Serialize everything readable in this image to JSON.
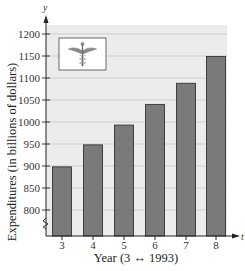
{
  "chart_data": {
    "type": "bar",
    "title": "",
    "xlabel": "Year (3 ↔ 1993)",
    "ylabel": "Expenditures (in billions of dollars)",
    "x_axis_variable": "t",
    "y_axis_variable": "y",
    "categories": [
      "3",
      "4",
      "5",
      "6",
      "7",
      "8"
    ],
    "values": [
      898,
      948,
      993,
      1040,
      1088,
      1149
    ],
    "ylim": [
      750,
      1225
    ],
    "y_ticks": [
      800,
      850,
      900,
      950,
      1000,
      1050,
      1100,
      1150,
      1200
    ],
    "y_axis_break": true,
    "grid": true,
    "legend": null,
    "inset_icon": "caduceus-icon",
    "colors": {
      "bar_fill": "#7a7a7a",
      "bar_stroke": "#333333",
      "plot_background": "#ececec",
      "gridline": "#c8c8c8",
      "axis": "#222222"
    }
  }
}
